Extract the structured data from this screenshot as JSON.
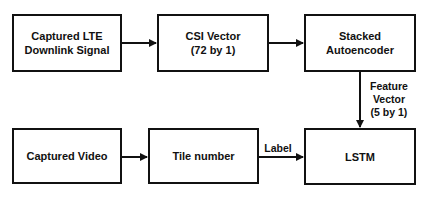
{
  "diagram": {
    "nodes": [
      {
        "id": "lte",
        "lines": [
          "Captured LTE",
          "Downlink Signal"
        ]
      },
      {
        "id": "csi",
        "lines": [
          "CSI Vector",
          "(72 by 1)"
        ]
      },
      {
        "id": "sae",
        "lines": [
          "Stacked",
          "Autoencoder"
        ]
      },
      {
        "id": "video",
        "lines": [
          "Captured Video"
        ]
      },
      {
        "id": "tile",
        "lines": [
          "Tile number"
        ]
      },
      {
        "id": "lstm",
        "lines": [
          "LSTM"
        ]
      }
    ],
    "edges": [
      {
        "from": "lte",
        "to": "csi",
        "label": ""
      },
      {
        "from": "csi",
        "to": "sae",
        "label": ""
      },
      {
        "from": "sae",
        "to": "lstm",
        "label_lines": [
          "Feature",
          "Vector",
          "(5 by 1)"
        ]
      },
      {
        "from": "video",
        "to": "tile",
        "label": ""
      },
      {
        "from": "tile",
        "to": "lstm",
        "label": "Label"
      }
    ],
    "colors": {
      "stroke": "#111111",
      "background": "#ffffff"
    }
  }
}
